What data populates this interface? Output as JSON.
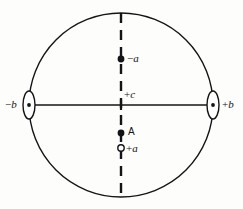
{
  "figure": {
    "type": "geometric-diagram",
    "background_color": "#fdfdfc",
    "stroke_color": "#141414"
  },
  "geometry": {
    "circle": {
      "cx": 121,
      "cy": 105,
      "r": 92,
      "stroke_width": 1.4
    },
    "horizontal_axis": {
      "x1": 29,
      "y1": 105,
      "x2": 213,
      "y2": 105,
      "stroke_width": 1.6,
      "style": "solid"
    },
    "vertical_axis": {
      "x1": 121,
      "y1": 13,
      "x2": 121,
      "y2": 197,
      "stroke_width": 2.2,
      "style": "dashed",
      "dash_pattern": "10 7"
    },
    "left_lens": {
      "cx": 29,
      "cy": 105,
      "rx": 6,
      "ry": 14
    },
    "right_lens": {
      "cx": 213,
      "cy": 105,
      "rx": 6,
      "ry": 14
    }
  },
  "markers": [
    {
      "id": "marker-minus-b",
      "name": "minus-b-node",
      "shape": "lens-with-dot",
      "cx": 29,
      "cy": 105,
      "label": "−b",
      "label_italic": true
    },
    {
      "id": "marker-plus-b",
      "name": "plus-b-node",
      "shape": "lens-with-dot",
      "cx": 213,
      "cy": 105,
      "label": "+b",
      "label_italic": true
    },
    {
      "id": "marker-minus-a",
      "name": "minus-a-node",
      "shape": "filled-dot",
      "cx": 121,
      "cy": 59,
      "r": 3.4,
      "label": "−a",
      "label_italic": true
    },
    {
      "id": "marker-plus-c",
      "name": "plus-c-node",
      "shape": "axis-crossing",
      "cx": 121,
      "cy": 105,
      "label": "+c",
      "label_italic": true
    },
    {
      "id": "marker-point-a",
      "name": "point-a-node",
      "shape": "filled-dot",
      "cx": 121,
      "cy": 133,
      "r": 3.4,
      "label": "A",
      "label_italic": false
    },
    {
      "id": "marker-plus-a",
      "name": "plus-a-node",
      "shape": "open-circle",
      "cx": 121,
      "cy": 148,
      "r": 3.2,
      "label": "+a",
      "label_italic": true
    }
  ],
  "labels": {
    "minus_b": {
      "prefix": "−",
      "symbol": "b"
    },
    "plus_b": {
      "prefix": "+",
      "symbol": "b"
    },
    "minus_a": {
      "prefix": "−",
      "symbol": "a"
    },
    "plus_c": {
      "prefix": "+",
      "symbol": "c"
    },
    "point_a": {
      "text": "A"
    },
    "plus_a": {
      "prefix": "+",
      "symbol": "a"
    }
  }
}
